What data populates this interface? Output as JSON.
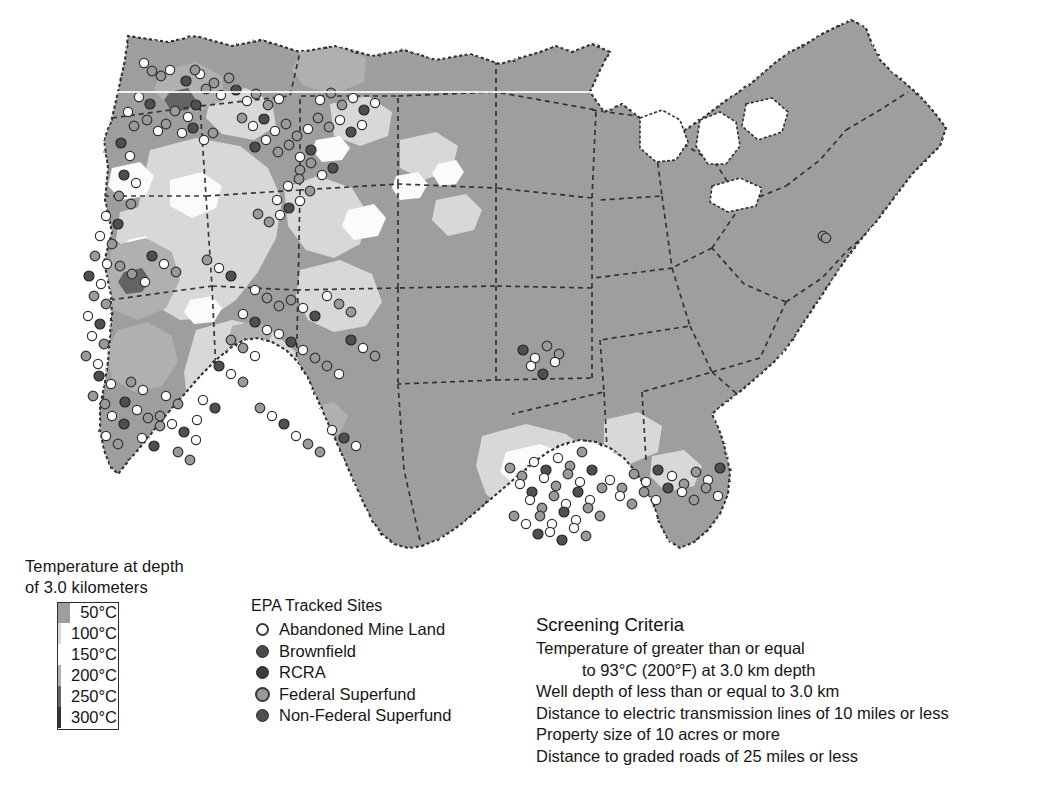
{
  "figure": {
    "kind": "map",
    "background_color": "#ffffff"
  },
  "temperature_legend": {
    "title": "Temperature at depth\nof 3.0 kilometers",
    "title_line1": "Temperature at depth",
    "title_line2": "of 3.0 kilometers",
    "classes": [
      {
        "label": "50°C",
        "color": "#9e9e9e"
      },
      {
        "label": "100°C",
        "color": "#d8d8d8"
      },
      {
        "label": "150°C",
        "color": "#fbfbfb"
      },
      {
        "label": "200°C",
        "color": "#b0b0b0"
      },
      {
        "label": "250°C",
        "color": "#636363"
      },
      {
        "label": "300°C",
        "color": "#343434"
      }
    ]
  },
  "sites_legend": {
    "title": "EPA Tracked Sites",
    "items": [
      {
        "label": "Abandoned Mine Land",
        "marker": "open-circle-marker",
        "fill": "#fdfdfd",
        "stroke": "#3a3a3a"
      },
      {
        "label": "Brownfield",
        "marker": "filled-circle-marker",
        "fill": "#4a4a4a",
        "stroke": "#2a2a2a"
      },
      {
        "label": "RCRA",
        "marker": "dark-circle-marker",
        "fill": "#3c3c3c",
        "stroke": "#222222"
      },
      {
        "label": "Federal Superfund",
        "marker": "gray-circle-marker",
        "fill": "#9a9a9a",
        "stroke": "#3a3a3a"
      },
      {
        "label": "Non-Federal Superfund",
        "marker": "filled-dark-circle-marker",
        "fill": "#4f4f4f",
        "stroke": "#2a2a2a"
      }
    ]
  },
  "screening_criteria": {
    "title": "Screening Criteria",
    "lines": [
      {
        "text": "Temperature of greater than or equal",
        "indent": false
      },
      {
        "text": "to 93°C (200°F) at 3.0 km depth",
        "indent": true
      },
      {
        "text": "Well depth of less than or equal to 3.0 km",
        "indent": false
      },
      {
        "text": "Distance to electric transmission lines of 10 miles or less",
        "indent": false
      },
      {
        "text": "Property size of 10 acres or more",
        "indent": false
      },
      {
        "text": "Distance to graded roads of 25 miles or less",
        "indent": false
      }
    ]
  },
  "caption": {
    "text": ""
  },
  "chart_data": {
    "type": "map",
    "projection": "contiguous-united-states",
    "choropleth_classes": [
      "50°C",
      "100°C",
      "150°C",
      "200°C",
      "250°C",
      "300°C"
    ],
    "class_colors": [
      "#9e9e9e",
      "#d8d8d8",
      "#fbfbfb",
      "#b0b0b0",
      "#636363",
      "#343434"
    ],
    "legend_position": "bottom-left",
    "marker_categories": [
      "Abandoned Mine Land",
      "Brownfield",
      "RCRA",
      "Federal Superfund",
      "Non-Federal Superfund"
    ],
    "marker_density_notes": [
      {
        "region": "Pacific Northwest (OR/WA/ID)",
        "density": "high"
      },
      {
        "region": "California coastal and Sierra",
        "density": "very high"
      },
      {
        "region": "Nevada / Great Basin",
        "density": "moderate"
      },
      {
        "region": "Colorado Front Range",
        "density": "moderate"
      },
      {
        "region": "Gulf Coast (TX/LA/MS/AL)",
        "density": "very high"
      },
      {
        "region": "Eastern United States",
        "density": "sparse"
      }
    ],
    "site_points": [
      [
        144,
        63
      ],
      [
        152,
        71
      ],
      [
        161,
        76
      ],
      [
        170,
        70
      ],
      [
        186,
        81
      ],
      [
        200,
        74
      ],
      [
        214,
        83
      ],
      [
        229,
        78
      ],
      [
        139,
        97
      ],
      [
        150,
        104
      ],
      [
        128,
        112
      ],
      [
        134,
        126
      ],
      [
        147,
        120
      ],
      [
        158,
        131
      ],
      [
        121,
        143
      ],
      [
        130,
        156
      ],
      [
        195,
        70
      ],
      [
        206,
        89
      ],
      [
        221,
        95
      ],
      [
        236,
        90
      ],
      [
        247,
        101
      ],
      [
        256,
        94
      ],
      [
        268,
        105
      ],
      [
        279,
        99
      ],
      [
        196,
        105
      ],
      [
        188,
        117
      ],
      [
        175,
        111
      ],
      [
        166,
        124
      ],
      [
        182,
        133
      ],
      [
        193,
        128
      ],
      [
        204,
        140
      ],
      [
        213,
        133
      ],
      [
        242,
        118
      ],
      [
        253,
        126
      ],
      [
        264,
        119
      ],
      [
        275,
        131
      ],
      [
        286,
        124
      ],
      [
        297,
        136
      ],
      [
        308,
        129
      ],
      [
        255,
        147
      ],
      [
        266,
        140
      ],
      [
        278,
        152
      ],
      [
        289,
        145
      ],
      [
        300,
        157
      ],
      [
        311,
        150
      ],
      [
        320,
        100
      ],
      [
        331,
        93
      ],
      [
        342,
        105
      ],
      [
        353,
        98
      ],
      [
        364,
        110
      ],
      [
        375,
        103
      ],
      [
        318,
        118
      ],
      [
        329,
        127
      ],
      [
        340,
        120
      ],
      [
        351,
        132
      ],
      [
        362,
        125
      ],
      [
        300,
        170
      ],
      [
        311,
        163
      ],
      [
        322,
        175
      ],
      [
        333,
        168
      ],
      [
        288,
        186
      ],
      [
        299,
        179
      ],
      [
        310,
        191
      ],
      [
        277,
        200
      ],
      [
        289,
        208
      ],
      [
        300,
        201
      ],
      [
        258,
        214
      ],
      [
        269,
        222
      ],
      [
        280,
        215
      ],
      [
        124,
        175
      ],
      [
        136,
        183
      ],
      [
        119,
        196
      ],
      [
        131,
        204
      ],
      [
        106,
        216
      ],
      [
        118,
        224
      ],
      [
        100,
        236
      ],
      [
        112,
        244
      ],
      [
        95,
        256
      ],
      [
        107,
        264
      ],
      [
        89,
        276
      ],
      [
        101,
        284
      ],
      [
        94,
        296
      ],
      [
        106,
        304
      ],
      [
        88,
        316
      ],
      [
        100,
        324
      ],
      [
        92,
        336
      ],
      [
        104,
        344
      ],
      [
        86,
        356
      ],
      [
        98,
        364
      ],
      [
        99,
        376
      ],
      [
        111,
        384
      ],
      [
        93,
        396
      ],
      [
        105,
        404
      ],
      [
        112,
        416
      ],
      [
        124,
        424
      ],
      [
        106,
        436
      ],
      [
        118,
        444
      ],
      [
        131,
        382
      ],
      [
        143,
        390
      ],
      [
        125,
        402
      ],
      [
        137,
        410
      ],
      [
        148,
        418
      ],
      [
        160,
        426
      ],
      [
        142,
        438
      ],
      [
        154,
        446
      ],
      [
        166,
        396
      ],
      [
        178,
        404
      ],
      [
        160,
        416
      ],
      [
        172,
        424
      ],
      [
        184,
        432
      ],
      [
        196,
        440
      ],
      [
        178,
        452
      ],
      [
        190,
        460
      ],
      [
        203,
        400
      ],
      [
        215,
        408
      ],
      [
        197,
        420
      ],
      [
        120,
        266
      ],
      [
        132,
        274
      ],
      [
        145,
        282
      ],
      [
        152,
        256
      ],
      [
        164,
        264
      ],
      [
        176,
        272
      ],
      [
        207,
        260
      ],
      [
        219,
        268
      ],
      [
        231,
        276
      ],
      [
        255,
        290
      ],
      [
        267,
        298
      ],
      [
        279,
        306
      ],
      [
        243,
        314
      ],
      [
        255,
        322
      ],
      [
        267,
        330
      ],
      [
        231,
        340
      ],
      [
        243,
        348
      ],
      [
        255,
        356
      ],
      [
        219,
        366
      ],
      [
        231,
        374
      ],
      [
        243,
        382
      ],
      [
        291,
        300
      ],
      [
        303,
        308
      ],
      [
        315,
        316
      ],
      [
        327,
        296
      ],
      [
        339,
        304
      ],
      [
        351,
        312
      ],
      [
        279,
        334
      ],
      [
        291,
        342
      ],
      [
        303,
        350
      ],
      [
        315,
        358
      ],
      [
        327,
        366
      ],
      [
        339,
        374
      ],
      [
        351,
        340
      ],
      [
        363,
        348
      ],
      [
        375,
        356
      ],
      [
        260,
        408
      ],
      [
        272,
        416
      ],
      [
        284,
        424
      ],
      [
        296,
        436
      ],
      [
        308,
        444
      ],
      [
        320,
        452
      ],
      [
        332,
        430
      ],
      [
        344,
        438
      ],
      [
        356,
        446
      ],
      [
        510,
        468
      ],
      [
        522,
        476
      ],
      [
        534,
        462
      ],
      [
        546,
        470
      ],
      [
        558,
        458
      ],
      [
        570,
        466
      ],
      [
        582,
        452
      ],
      [
        520,
        484
      ],
      [
        532,
        492
      ],
      [
        544,
        478
      ],
      [
        556,
        486
      ],
      [
        568,
        474
      ],
      [
        580,
        482
      ],
      [
        592,
        470
      ],
      [
        530,
        500
      ],
      [
        542,
        508
      ],
      [
        554,
        496
      ],
      [
        566,
        504
      ],
      [
        578,
        492
      ],
      [
        590,
        500
      ],
      [
        602,
        488
      ],
      [
        540,
        516
      ],
      [
        552,
        524
      ],
      [
        564,
        512
      ],
      [
        576,
        520
      ],
      [
        588,
        508
      ],
      [
        600,
        516
      ],
      [
        550,
        532
      ],
      [
        562,
        540
      ],
      [
        574,
        528
      ],
      [
        586,
        536
      ],
      [
        514,
        516
      ],
      [
        526,
        524
      ],
      [
        538,
        534
      ],
      [
        610,
        480
      ],
      [
        622,
        488
      ],
      [
        634,
        474
      ],
      [
        646,
        482
      ],
      [
        658,
        470
      ],
      [
        620,
        496
      ],
      [
        632,
        504
      ],
      [
        644,
        492
      ],
      [
        656,
        500
      ],
      [
        668,
        488
      ],
      [
        672,
        476
      ],
      [
        684,
        484
      ],
      [
        696,
        472
      ],
      [
        708,
        480
      ],
      [
        720,
        468
      ],
      [
        682,
        492
      ],
      [
        694,
        500
      ],
      [
        706,
        488
      ],
      [
        718,
        496
      ],
      [
        523,
        350
      ],
      [
        535,
        358
      ],
      [
        547,
        346
      ],
      [
        559,
        354
      ],
      [
        531,
        366
      ],
      [
        543,
        374
      ],
      [
        555,
        362
      ],
      [
        823,
        236
      ],
      [
        826,
        238
      ]
    ]
  }
}
